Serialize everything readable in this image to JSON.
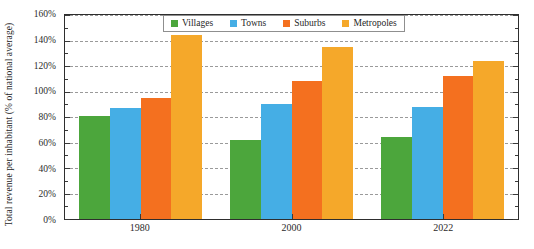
{
  "chart_data": {
    "type": "bar",
    "title": "",
    "subtitle": "",
    "xlabel": "",
    "ylabel": "Total revenue per inhabitant (% of national average)",
    "categories": [
      "1980",
      "2000",
      "2022"
    ],
    "series": [
      {
        "name": "Villages",
        "color": "#4CA63C",
        "values": [
          81,
          62,
          64
        ]
      },
      {
        "name": "Towns",
        "color": "#45AEE5",
        "values": [
          87,
          90,
          88
        ]
      },
      {
        "name": "Suburbs",
        "color": "#F4701F",
        "values": [
          95,
          108,
          112
        ]
      },
      {
        "name": "Metropoles",
        "color": "#F5A82A",
        "values": [
          144,
          135,
          124
        ]
      }
    ],
    "ylim": [
      0,
      160
    ],
    "ytick_values": [
      0,
      20,
      40,
      60,
      80,
      100,
      120,
      140,
      160
    ],
    "ytick_labels": [
      "0%",
      "20%",
      "40%",
      "60%",
      "80%",
      "100%",
      "120%",
      "140%",
      "160%"
    ],
    "grid": true,
    "legend_position": "top-center"
  }
}
